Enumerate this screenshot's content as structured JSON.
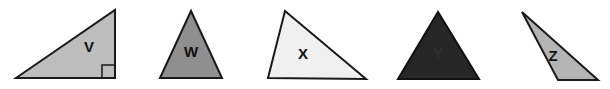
{
  "diagram": {
    "type": "triangle-set",
    "triangles": [
      {
        "id": "V",
        "label": "V",
        "fill": "#bdbdbd",
        "stroke": "#1a1a1a",
        "label_color": "#111111",
        "points": "16,78 115,10 115,78",
        "label_pos": [
          89,
          52
        ],
        "right_angle_marker": true,
        "kind": "right"
      },
      {
        "id": "W",
        "label": "W",
        "fill": "#8f8f8f",
        "stroke": "#1a1a1a",
        "label_color": "#111111",
        "points": "160,78 191,11 222,78",
        "label_pos": [
          191,
          57
        ],
        "right_angle_marker": false,
        "kind": "isosceles"
      },
      {
        "id": "X",
        "label": "X",
        "fill": "#f0f0f0",
        "stroke": "#1a1a1a",
        "label_color": "#111111",
        "points": "268,78 285,11 366,79",
        "label_pos": [
          303,
          59
        ],
        "right_angle_marker": false,
        "kind": "scalene"
      },
      {
        "id": "Y",
        "label": "Y",
        "fill": "#262626",
        "stroke": "#111111",
        "label_color": "#2e2e2e",
        "points": "398,79 438,12 479,79",
        "label_pos": [
          438,
          58
        ],
        "right_angle_marker": false,
        "kind": "equilateral"
      },
      {
        "id": "Z",
        "label": "Z",
        "fill": "#b4b4b4",
        "stroke": "#1a1a1a",
        "label_color": "#111111",
        "points": "522,12 558,80 598,80",
        "label_pos": [
          553,
          61
        ],
        "right_angle_marker": false,
        "kind": "obtuse"
      }
    ]
  }
}
